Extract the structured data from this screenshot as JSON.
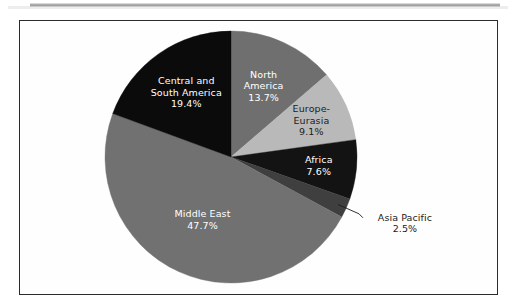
{
  "page": {
    "background_color": "#ffffff",
    "scan_band_color": "#9a9a9a"
  },
  "frame": {
    "border_color": "#2b2b2b",
    "fill_color": "#fefefe"
  },
  "chart_data": {
    "type": "pie",
    "title": "",
    "subtitle": "",
    "xlabel": "",
    "ylabel": "",
    "legend_position": "none",
    "grid": false,
    "start_angle_deg": 0,
    "direction": "clockwise",
    "units": "percent",
    "total": 100.0,
    "categories": [
      "North America",
      "Europe-Eurasia",
      "Africa",
      "Asia Pacific",
      "Middle East",
      "Central and South America"
    ],
    "values": [
      13.7,
      9.1,
      7.6,
      2.5,
      47.7,
      19.4
    ],
    "colors": [
      "#6f6f6f",
      "#b9b9b9",
      "#131313",
      "#3f3f3f",
      "#717171",
      "#0b0b0b"
    ],
    "slices": [
      {
        "name": "North America",
        "value": 13.7,
        "value_label": "13.7%",
        "label_lines": [
          "North",
          "America",
          "13.7%"
        ],
        "color": "#6f6f6f",
        "text_color": "#ffffff",
        "label_placement": "inside"
      },
      {
        "name": "Europe-Eurasia",
        "value": 9.1,
        "value_label": "9.1%",
        "label_lines": [
          "Europe-",
          "Eurasia",
          "9.1%"
        ],
        "color": "#b9b9b9",
        "text_color": "#1c1c1c",
        "label_placement": "inside"
      },
      {
        "name": "Africa",
        "value": 7.6,
        "value_label": "7.6%",
        "label_lines": [
          "Africa",
          "7.6%"
        ],
        "color": "#131313",
        "text_color": "#ffffff",
        "label_placement": "inside"
      },
      {
        "name": "Asia Pacific",
        "value": 2.5,
        "value_label": "2.5%",
        "label_lines": [
          "Asia Pacific",
          "2.5%"
        ],
        "color": "#3f3f3f",
        "text_color": "#1c1c1c",
        "label_placement": "outside",
        "has_leader_line": true
      },
      {
        "name": "Middle East",
        "value": 47.7,
        "value_label": "47.7%",
        "label_lines": [
          "Middle East",
          "47.7%"
        ],
        "color": "#717171",
        "text_color": "#ffffff",
        "label_placement": "inside"
      },
      {
        "name": "Central and South America",
        "value": 19.4,
        "value_label": "19.4%",
        "label_lines": [
          "Central and",
          "South America",
          "19.4%"
        ],
        "color": "#0b0b0b",
        "text_color": "#ffffff",
        "label_placement": "inside"
      }
    ]
  }
}
